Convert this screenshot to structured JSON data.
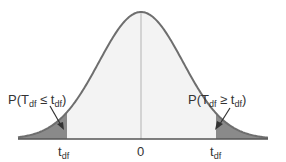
{
  "diagram": {
    "type": "t-distribution density curve with two shaded tails",
    "labels": {
      "left_prob": "P(T_df ≤ t_df)",
      "right_prob": "P(T_df ≥ t_df)",
      "left_tick": "t_df",
      "center_tick": "0",
      "right_tick": "t_df"
    },
    "colors": {
      "curve": "#6e6e6e",
      "body_fill": "#f3f3f3",
      "tail_fill": "#8a8a8a",
      "axis": "#555555",
      "center_line": "#c8c8c8"
    }
  }
}
